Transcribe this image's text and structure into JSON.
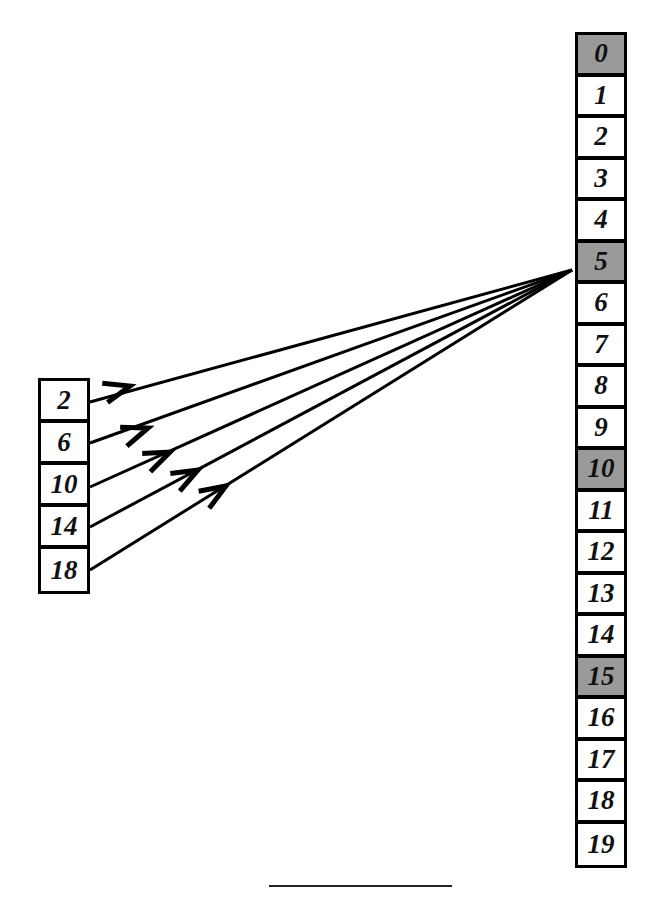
{
  "diagram": {
    "right_array": {
      "cells": [
        {
          "label": "0",
          "highlighted": true
        },
        {
          "label": "1",
          "highlighted": false
        },
        {
          "label": "2",
          "highlighted": false
        },
        {
          "label": "3",
          "highlighted": false
        },
        {
          "label": "4",
          "highlighted": false
        },
        {
          "label": "5",
          "highlighted": true
        },
        {
          "label": "6",
          "highlighted": false
        },
        {
          "label": "7",
          "highlighted": false
        },
        {
          "label": "8",
          "highlighted": false
        },
        {
          "label": "9",
          "highlighted": false
        },
        {
          "label": "10",
          "highlighted": true
        },
        {
          "label": "11",
          "highlighted": false
        },
        {
          "label": "12",
          "highlighted": false
        },
        {
          "label": "13",
          "highlighted": false
        },
        {
          "label": "14",
          "highlighted": false
        },
        {
          "label": "15",
          "highlighted": true
        },
        {
          "label": "16",
          "highlighted": false
        },
        {
          "label": "17",
          "highlighted": false
        },
        {
          "label": "18",
          "highlighted": false
        },
        {
          "label": "19",
          "highlighted": false
        }
      ]
    },
    "left_array": {
      "cells": [
        {
          "label": "2"
        },
        {
          "label": "6"
        },
        {
          "label": "10"
        },
        {
          "label": "14"
        },
        {
          "label": "18"
        }
      ]
    },
    "arrows": {
      "target_cell": "5",
      "sources": [
        "2",
        "6",
        "10",
        "14",
        "18"
      ]
    },
    "colors": {
      "highlight": "#9a9a9a",
      "ink": "#000000"
    }
  }
}
